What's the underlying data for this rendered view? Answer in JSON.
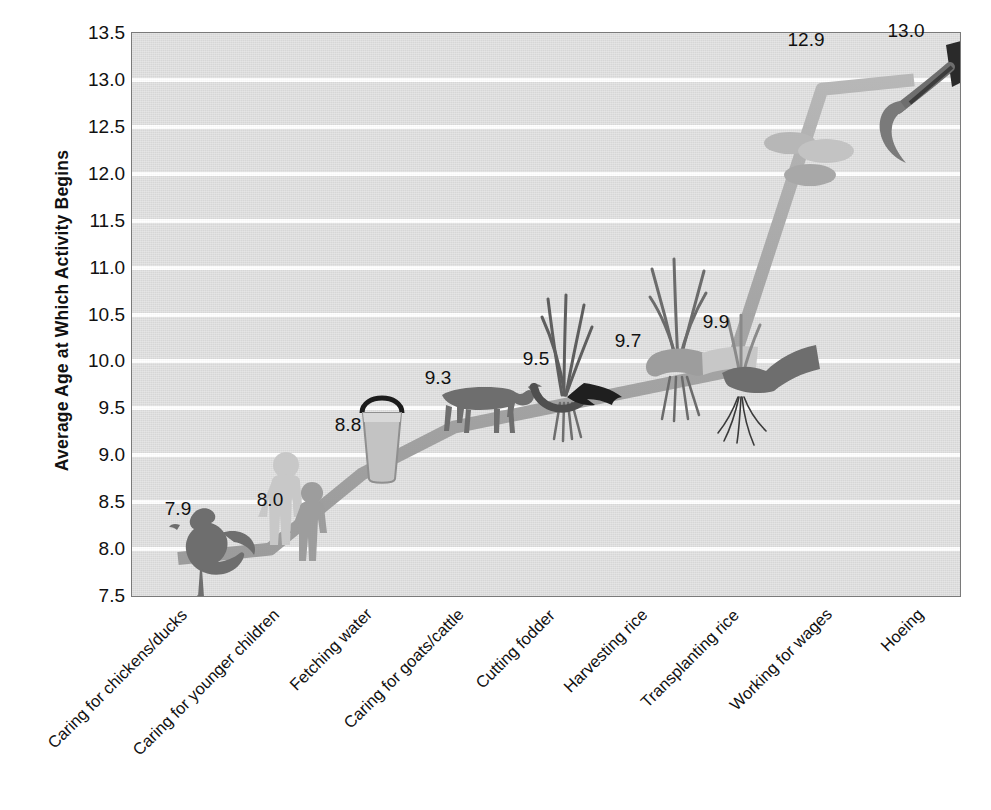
{
  "chart_data": {
    "type": "line",
    "title": "",
    "xlabel": "",
    "ylabel": "Average Age at Which Activity Begins",
    "categories": [
      "Caring for chickens/ducks",
      "Caring for younger children",
      "Fetching water",
      "Caring for goats/cattle",
      "Cutting fodder",
      "Harvesting rice",
      "Transplanting rice",
      "Working for wages",
      "Hoeing"
    ],
    "values": [
      7.9,
      8.0,
      8.8,
      9.3,
      9.5,
      9.7,
      9.9,
      12.9,
      13.0
    ],
    "data_labels": [
      "7.9",
      "8.0",
      "8.8",
      "9.3",
      "9.5",
      "9.7",
      "9.9",
      "12.9",
      "13.0"
    ],
    "ylim": [
      7.5,
      13.5
    ],
    "yticks": [
      "13.5",
      "13.0",
      "12.5",
      "12.0",
      "11.5",
      "11.0",
      "10.5",
      "10.0",
      "9.5",
      "9.0",
      "8.5",
      "8.0",
      "7.5"
    ],
    "ytick_values": [
      13.5,
      13.0,
      12.5,
      12.0,
      11.5,
      11.0,
      10.5,
      10.0,
      9.5,
      9.0,
      8.5,
      8.0,
      7.5
    ],
    "grid": true,
    "legend": "none",
    "series_color": "#a9a9a9",
    "plot_background": "#dddddd",
    "gridline_color": "#ffffff",
    "point_icons": [
      "chicken-icon",
      "two-children-icon",
      "water-bucket-icon",
      "cattle-icon",
      "fodder-sickle-icon",
      "rice-sheaf-icon",
      "rice-seedling-icon",
      "coins-icon",
      "hoe-icon"
    ]
  }
}
